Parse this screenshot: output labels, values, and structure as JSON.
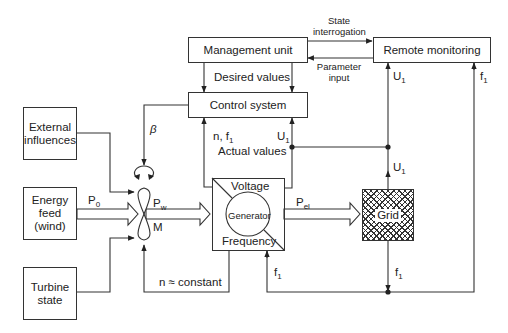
{
  "diagram": {
    "type": "block-diagram",
    "blocks": {
      "management_unit": "Management unit",
      "remote_monitoring": "Remote monitoring",
      "control_system": "Control system",
      "external_influences": "External influences",
      "energy_feed": "Energy feed (wind)",
      "turbine_state": "Turbine state",
      "generator": "Generator",
      "generator_voltage": "Voltage",
      "generator_frequency": "Frequency",
      "grid": "Grid"
    },
    "labels": {
      "state_interrogation": "State interrogation",
      "parameter_input": "Parameter input",
      "desired_values": "Desired values",
      "actual_values": "Actual values",
      "beta": "β",
      "n_f1": "n, f",
      "n_f1_sub": "1",
      "u1_control": "U",
      "u1_remote": "U",
      "u1_grid": "U",
      "f1_remote": "f",
      "f1_generator": "f",
      "f1_grid": "f",
      "sub_1": "1",
      "p0": "P",
      "p0_sub": "0",
      "pw": "P",
      "pw_sub": "w",
      "m": "M",
      "pel": "P",
      "pel_sub": "el",
      "n_constant": "n ≈ constant"
    },
    "connections": [
      {
        "from": "Management unit",
        "to": "Remote monitoring",
        "label": "State interrogation"
      },
      {
        "from": "Remote monitoring",
        "to": "Management unit",
        "label": "Parameter input"
      },
      {
        "from": "Management unit",
        "to": "Control system",
        "label": "Desired values"
      },
      {
        "from": "Control system",
        "to": "Rotor",
        "label": "β"
      },
      {
        "from": "Generator",
        "to": "Control system",
        "label": "n, f1"
      },
      {
        "from": "Grid",
        "to": "Control system",
        "label": "U1 (Actual values)"
      },
      {
        "from": "Grid",
        "to": "Remote monitoring",
        "label": "U1"
      },
      {
        "from": "Grid",
        "to": "Remote monitoring",
        "label": "f1"
      },
      {
        "from": "Grid",
        "to": "Generator",
        "label": "f1"
      },
      {
        "from": "External influences",
        "to": "Rotor"
      },
      {
        "from": "Turbine state",
        "to": "Rotor"
      },
      {
        "from": "Energy feed (wind)",
        "to": "Rotor",
        "label": "P0"
      },
      {
        "from": "Rotor",
        "to": "Generator",
        "label": "Pw / M"
      },
      {
        "from": "Generator",
        "to": "Grid",
        "label": "Pel"
      },
      {
        "from": "Generator",
        "to": "Rotor",
        "label": "n ≈ constant"
      }
    ]
  }
}
